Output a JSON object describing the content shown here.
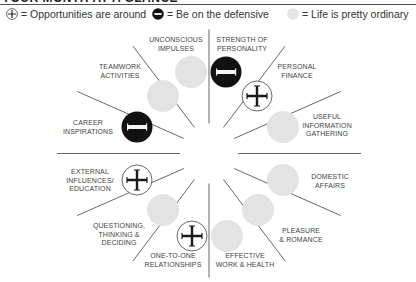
{
  "title": "YOUR MONTH AT A GLANCE",
  "legend": [
    {
      "symbol": "plus-icon",
      "text": "= Opportunities are around"
    },
    {
      "symbol": "minus-icon",
      "text": "= Be on the defensive"
    },
    {
      "symbol": "neutral-icon",
      "text": "= Life is pretty ordinary"
    }
  ],
  "colors": {
    "line": "#555555",
    "defensive": "#111111",
    "ordinary": "#e3e3e3",
    "opportunity_ring": "#444444",
    "text": "#444444"
  },
  "segments": [
    {
      "id": "strength-of-personality",
      "label": "STRENGTH OF\nPERSONALITY",
      "status": "defensive"
    },
    {
      "id": "personal-finance",
      "label": "PERSONAL\nFINANCE",
      "status": "opportunity"
    },
    {
      "id": "useful-information-gathering",
      "label": "USEFUL\nINFORMATION\nGATHERING",
      "status": "ordinary"
    },
    {
      "id": "domestic-affairs",
      "label": "DOMESTIC\nAFFAIRS",
      "status": "ordinary"
    },
    {
      "id": "pleasure-romance",
      "label": "PLEASURE\n& ROMANCE",
      "status": "ordinary"
    },
    {
      "id": "effective-work-health",
      "label": "EFFECTIVE\nWORK & HEALTH",
      "status": "ordinary"
    },
    {
      "id": "one-to-one-relationships",
      "label": "ONE-TO-ONE\nRELATIONSHIPS",
      "status": "opportunity"
    },
    {
      "id": "questioning-thinking-deciding",
      "label": "QUESTIONING,\nTHINKING &\nDECIDING",
      "status": "ordinary"
    },
    {
      "id": "external-influences-education",
      "label": "EXTERNAL\nINFLUENCES/\nEDUCATION",
      "status": "opportunity"
    },
    {
      "id": "career-inspirations",
      "label": "CAREER\nINSPIRATIONS",
      "status": "defensive"
    },
    {
      "id": "teamwork-activities",
      "label": "TEAMWORK\nACTIVITIES",
      "status": "ordinary"
    },
    {
      "id": "unconscious-impulses",
      "label": "UNCONSCIOUS\nIMPULSES",
      "status": "ordinary"
    }
  ]
}
